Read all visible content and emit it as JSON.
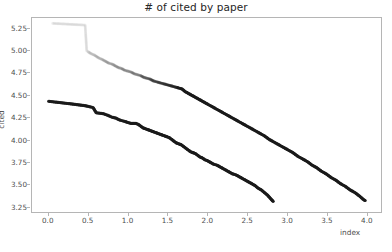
{
  "chart_data": {
    "type": "scatter",
    "title": "# of cited by paper",
    "xlabel": "index",
    "ylabel": "cited",
    "xlim": [
      -0.21,
      4.19
    ],
    "ylim": [
      3.18,
      5.37
    ],
    "grid": false,
    "legend": null,
    "xticks": [
      "0.0",
      "0.5",
      "1.0",
      "1.5",
      "2.0",
      "2.5",
      "3.0",
      "3.5",
      "4.0"
    ],
    "xtick_values": [
      0.0,
      0.5,
      1.0,
      1.5,
      2.0,
      2.5,
      3.0,
      3.5,
      4.0
    ],
    "yticks": [
      "3.25",
      "3.50",
      "3.75",
      "4.00",
      "4.25",
      "4.50",
      "4.75",
      "5.00",
      "5.25"
    ],
    "ytick_values": [
      3.25,
      3.5,
      3.75,
      4.0,
      4.25,
      4.5,
      4.75,
      5.0,
      5.25
    ],
    "marker": "point",
    "marker_size": 1.6,
    "series": [
      {
        "name": "upper-curve",
        "color": "#1a1a1a",
        "x": [
          0.05,
          0.46,
          0.48,
          0.53,
          0.58,
          0.63,
          0.68,
          0.72,
          0.76,
          0.8,
          0.84,
          0.88,
          0.92,
          0.96,
          1.0,
          1.04,
          1.08,
          1.12,
          1.16,
          1.2,
          1.24,
          1.28,
          1.32,
          1.36,
          1.4,
          1.44,
          1.48,
          1.52,
          1.56,
          1.6,
          1.64,
          1.68,
          1.72,
          1.76,
          1.8,
          1.84,
          1.88,
          1.92,
          1.96,
          2.0,
          2.06,
          2.12,
          2.18,
          2.24,
          2.3,
          2.36,
          2.42,
          2.48,
          2.54,
          2.6,
          2.66,
          2.72,
          2.78,
          2.84,
          2.9,
          2.96,
          3.02,
          3.08,
          3.14,
          3.2,
          3.26,
          3.32,
          3.38,
          3.44,
          3.5,
          3.56,
          3.62,
          3.68,
          3.74,
          3.8,
          3.86,
          3.92,
          3.97,
          3.99
        ],
        "y": [
          5.31,
          5.29,
          5.0,
          4.97,
          4.95,
          4.92,
          4.9,
          4.88,
          4.86,
          4.85,
          4.83,
          4.81,
          4.8,
          4.78,
          4.77,
          4.76,
          4.74,
          4.73,
          4.72,
          4.7,
          4.69,
          4.68,
          4.66,
          4.65,
          4.64,
          4.63,
          4.62,
          4.61,
          4.6,
          4.59,
          4.58,
          4.57,
          4.54,
          4.52,
          4.5,
          4.48,
          4.46,
          4.44,
          4.42,
          4.4,
          4.37,
          4.34,
          4.31,
          4.28,
          4.25,
          4.22,
          4.19,
          4.16,
          4.13,
          4.1,
          4.07,
          4.04,
          4.0,
          3.97,
          3.94,
          3.91,
          3.88,
          3.85,
          3.81,
          3.78,
          3.75,
          3.71,
          3.68,
          3.64,
          3.61,
          3.57,
          3.54,
          3.5,
          3.47,
          3.43,
          3.4,
          3.36,
          3.32,
          3.31
        ]
      },
      {
        "name": "lower-curve",
        "color": "#1a1a1a",
        "x": [
          0.0,
          0.29,
          0.46,
          0.56,
          0.6,
          0.69,
          0.75,
          0.8,
          0.85,
          0.89,
          0.93,
          0.97,
          1.0,
          1.04,
          1.07,
          1.1,
          1.13,
          1.16,
          1.19,
          1.22,
          1.25,
          1.28,
          1.31,
          1.34,
          1.37,
          1.4,
          1.43,
          1.46,
          1.49,
          1.52,
          1.55,
          1.58,
          1.61,
          1.64,
          1.67,
          1.7,
          1.73,
          1.76,
          1.79,
          1.82,
          1.85,
          1.88,
          1.91,
          1.94,
          1.97,
          2.0,
          2.04,
          2.08,
          2.12,
          2.16,
          2.2,
          2.24,
          2.28,
          2.32,
          2.36,
          2.4,
          2.44,
          2.48,
          2.52,
          2.56,
          2.6,
          2.64,
          2.68,
          2.72,
          2.76,
          2.8,
          2.83
        ],
        "y": [
          4.43,
          4.4,
          4.38,
          4.36,
          4.3,
          4.29,
          4.27,
          4.25,
          4.24,
          4.22,
          4.21,
          4.2,
          4.19,
          4.18,
          4.18,
          4.18,
          4.17,
          4.15,
          4.13,
          4.12,
          4.11,
          4.1,
          4.09,
          4.08,
          4.07,
          4.06,
          4.05,
          4.04,
          4.03,
          4.02,
          4.0,
          3.98,
          3.96,
          3.95,
          3.94,
          3.92,
          3.9,
          3.88,
          3.86,
          3.85,
          3.84,
          3.82,
          3.8,
          3.79,
          3.77,
          3.76,
          3.74,
          3.72,
          3.71,
          3.69,
          3.67,
          3.65,
          3.63,
          3.61,
          3.6,
          3.58,
          3.56,
          3.54,
          3.52,
          3.5,
          3.48,
          3.45,
          3.43,
          3.4,
          3.37,
          3.33,
          3.3
        ]
      }
    ]
  }
}
